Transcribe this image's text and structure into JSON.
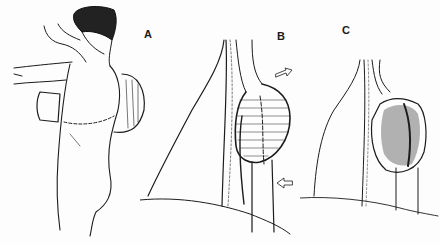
{
  "figure": {
    "ink_color": "#1c1c1c",
    "background_color": "#fdfdfd",
    "panels": [
      {
        "label": "A",
        "subject": "back view of figure with raised arm and shoulder swelling, dashed incision line"
      },
      {
        "label": "B",
        "subject": "anatomical view of swollen lobulated mass on vessel with two arrows"
      },
      {
        "label": "C",
        "subject": "anatomical view of reduced fibrous mass on vessel"
      }
    ]
  }
}
